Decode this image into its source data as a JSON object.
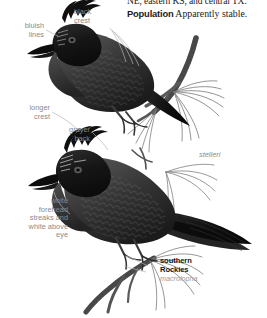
{
  "page": {
    "width": 267,
    "height": 318,
    "background": "#ffffff",
    "kind": "field-guide-plate"
  },
  "body_text": {
    "clipped_line": "NE, eastern KS, and central TX.",
    "population": {
      "lead": "Population",
      "text": "Apparently stable."
    }
  },
  "annotations": [
    {
      "id": "bluish-lines",
      "text": "bluish\nlines",
      "align": "right"
    },
    {
      "id": "black-crest",
      "text": "black\ncrest",
      "align": "left"
    },
    {
      "id": "longer-crest",
      "text": "longer\ncrest",
      "align": "right"
    },
    {
      "id": "grayer-back",
      "text": "grayer\nback",
      "align": "right"
    },
    {
      "id": "white-forehead",
      "text": "white\nforehead\nstreaks and\nwhite above\neye",
      "align": "right"
    }
  ],
  "subspecies": [
    {
      "id": "stelleri",
      "common": "",
      "scientific": "stelleri"
    },
    {
      "id": "macrolopha",
      "common": "southern\nRockies",
      "scientific": "macrolopha"
    }
  ],
  "colors": {
    "label_gray": "#8a8a8a",
    "sci_gray": "#9a9a9a",
    "ink": "#161616",
    "body_text": "#1a1a1a",
    "bird_dark": "#121212",
    "bird_mid": "#3a3a3a",
    "bird_light": "#6e6e6e",
    "branch": "#4a4a4a",
    "needle": "#777777"
  },
  "illustration": {
    "subjects": [
      {
        "name": "stellers-jay-upper",
        "pose": "perched on branch, facing left, crest raised"
      },
      {
        "name": "stellers-jay-lower",
        "pose": "perched on branch, facing left, long tail to right"
      }
    ],
    "props": [
      "pine-branch-upper",
      "pine-needles-upper",
      "pine-branch-lower",
      "pine-needles-lower"
    ]
  }
}
